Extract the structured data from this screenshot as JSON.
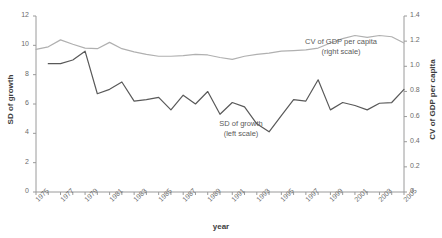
{
  "chart_data": {
    "type": "line",
    "title": "",
    "xlabel": "year",
    "ylabel": "SD of growth",
    "ylabel_right": "CV of GDP per capita",
    "xlim": [
      1975,
      2005
    ],
    "ylim": [
      0,
      12
    ],
    "ylim_right": [
      0,
      1.4
    ],
    "grid": false,
    "legend": "inline-annotations",
    "x": [
      1975,
      1976,
      1977,
      1978,
      1979,
      1980,
      1981,
      1982,
      1983,
      1984,
      1985,
      1986,
      1987,
      1988,
      1989,
      1990,
      1991,
      1992,
      1993,
      1994,
      1995,
      1996,
      1997,
      1998,
      1999,
      2000,
      2001,
      2002,
      2003,
      2004,
      2005
    ],
    "xticks": [
      "1975",
      "1977",
      "1979",
      "1981",
      "1983",
      "1985",
      "1987",
      "1989",
      "1991",
      "1993",
      "1995",
      "1997",
      "1999",
      "2001",
      "2003",
      "2005"
    ],
    "yticks_left": [
      "0",
      "2",
      "4",
      "6",
      "8",
      "10",
      "12"
    ],
    "yticks_right": [
      "0",
      "0.2",
      "0.4",
      "0.6",
      "0.8",
      "1.0",
      "1.2",
      "1.4"
    ],
    "series": [
      {
        "name": "SD of growth",
        "axis": "left",
        "color": "#595959",
        "annotation": "SD of growth\n(left scale)",
        "annotation_line1": "SD of growth",
        "annotation_line2": "(left scale)",
        "values": [
          null,
          8.75,
          8.75,
          9.0,
          9.6,
          6.7,
          7.0,
          7.5,
          6.2,
          6.3,
          6.45,
          5.6,
          6.6,
          6.0,
          6.85,
          5.3,
          6.1,
          5.8,
          4.65,
          4.1,
          5.2,
          6.3,
          6.2,
          7.65,
          5.6,
          6.1,
          5.9,
          5.6,
          6.05,
          6.1,
          7.0
        ]
      },
      {
        "name": "CV of GDP per capita",
        "axis": "right",
        "color": "#b0b0b0",
        "annotation": "CV of GDP per capita\n(right scale)",
        "annotation_line1": "CV of GDP per capita",
        "annotation_line2": "(right scale)",
        "values": [
          1.135,
          1.155,
          1.21,
          1.175,
          1.145,
          1.14,
          1.19,
          1.14,
          1.115,
          1.095,
          1.08,
          1.08,
          1.085,
          1.095,
          1.09,
          1.07,
          1.055,
          1.08,
          1.095,
          1.105,
          1.12,
          1.125,
          1.13,
          1.145,
          1.185,
          1.22,
          1.245,
          1.23,
          1.245,
          1.235,
          1.185
        ]
      }
    ]
  }
}
